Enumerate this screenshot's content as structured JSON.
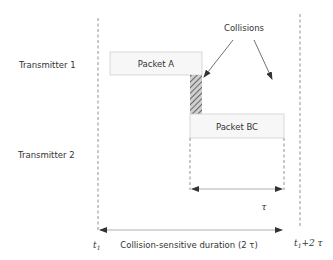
{
  "diagram": {
    "transmitters": [
      {
        "label": "Transmitter 1"
      },
      {
        "label": "Transmitter 2"
      }
    ],
    "packets": [
      {
        "label": "Packet A"
      },
      {
        "label": "Packet BC"
      }
    ],
    "collisions_label": "Collisions",
    "tau_label": "τ",
    "start_time": {
      "base": "t",
      "sub": "1"
    },
    "end_time": {
      "base": "t",
      "sub": "1",
      "suffix": "+2 τ"
    },
    "duration_label": "Collision-sensitive duration (2 τ)",
    "colors": {
      "box_fill": "#f7f7f7",
      "box_stroke": "#c8c8c8",
      "hatch": "#666666",
      "line": "#555555"
    }
  }
}
